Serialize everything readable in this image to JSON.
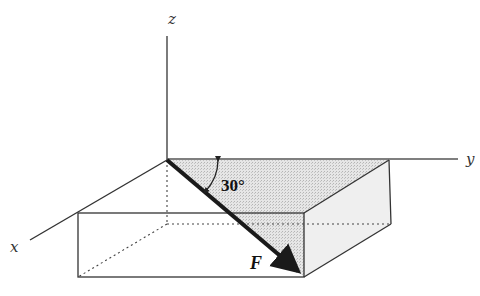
{
  "diagram": {
    "type": "3d-force-vector",
    "axes": {
      "x_label": "x",
      "y_label": "y",
      "z_label": "z"
    },
    "force": {
      "label": "F",
      "angle_label": "30°"
    },
    "colors": {
      "line": "#333333",
      "force_arrow": "#1a1a1a",
      "shade": "#d9d9d9",
      "background": "#ffffff"
    }
  }
}
